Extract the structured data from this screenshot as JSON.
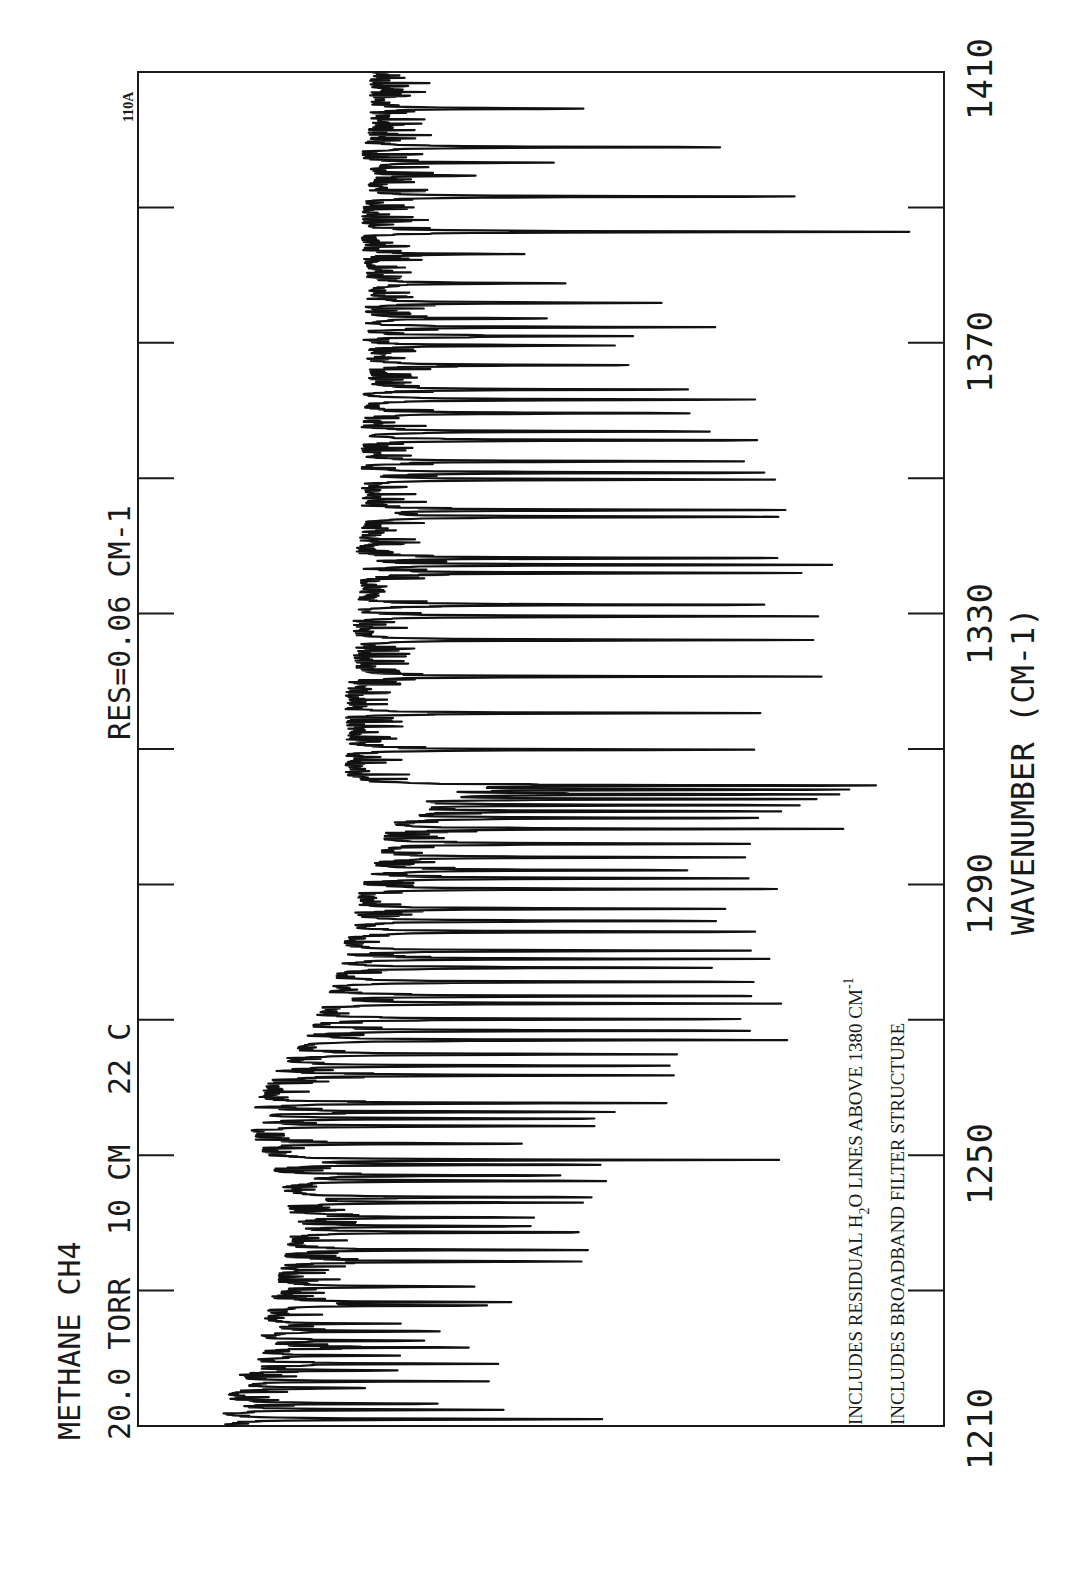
{
  "chart_data": {
    "type": "line",
    "orientation": "rotated-90-ccw",
    "title": "METHANE  CH4",
    "subtitle": "20.0 TORR  10 CM  22 C",
    "annotation_res": "RES=0.06 CM-1",
    "plot_id": "110A",
    "notes": [
      "INCLUDES RESIDUAL H2O LINES ABOVE 1380 CM-1",
      "INCLUDES BROADBAND FILTER STRUCTURE"
    ],
    "xlabel": "WAVENUMBER (CM-1)",
    "ylabel": "",
    "xlim": [
      1210,
      1410
    ],
    "ylim": [
      0,
      1
    ],
    "xticks": [
      1210,
      1250,
      1290,
      1330,
      1370,
      1410
    ],
    "minor_ticks": [
      1230,
      1270,
      1310,
      1350,
      1390
    ],
    "grid": false,
    "legend": null,
    "baseline_transmittance": [
      [
        1210,
        0.89
      ],
      [
        1214,
        0.88
      ],
      [
        1218,
        0.86
      ],
      [
        1222,
        0.84
      ],
      [
        1226,
        0.83
      ],
      [
        1230,
        0.82
      ],
      [
        1234,
        0.81
      ],
      [
        1238,
        0.8
      ],
      [
        1242,
        0.8
      ],
      [
        1246,
        0.81
      ],
      [
        1250,
        0.83
      ],
      [
        1254,
        0.85
      ],
      [
        1258,
        0.84
      ],
      [
        1262,
        0.82
      ],
      [
        1266,
        0.79
      ],
      [
        1270,
        0.77
      ],
      [
        1274,
        0.75
      ],
      [
        1278,
        0.74
      ],
      [
        1282,
        0.73
      ],
      [
        1286,
        0.72
      ],
      [
        1290,
        0.71
      ],
      [
        1294,
        0.69
      ],
      [
        1298,
        0.68
      ],
      [
        1302,
        0.67
      ],
      [
        1304,
        0.66
      ],
      [
        1306,
        0.73
      ],
      [
        1310,
        0.73
      ],
      [
        1314,
        0.73
      ],
      [
        1318,
        0.73
      ],
      [
        1322,
        0.72
      ],
      [
        1326,
        0.72
      ],
      [
        1330,
        0.72
      ],
      [
        1334,
        0.71
      ],
      [
        1338,
        0.72
      ],
      [
        1342,
        0.71
      ],
      [
        1346,
        0.71
      ],
      [
        1350,
        0.71
      ],
      [
        1354,
        0.71
      ],
      [
        1358,
        0.71
      ],
      [
        1362,
        0.71
      ],
      [
        1366,
        0.7
      ],
      [
        1370,
        0.71
      ],
      [
        1374,
        0.71
      ],
      [
        1378,
        0.7
      ],
      [
        1382,
        0.71
      ],
      [
        1386,
        0.71
      ],
      [
        1390,
        0.71
      ],
      [
        1394,
        0.7
      ],
      [
        1398,
        0.71
      ],
      [
        1402,
        0.7
      ],
      [
        1406,
        0.7
      ],
      [
        1410,
        0.7
      ]
    ],
    "absorption_lines": [
      {
        "wn": 1211.0,
        "t": 0.4
      },
      {
        "wn": 1212.4,
        "t": 0.55
      },
      {
        "wn": 1213.3,
        "t": 0.62
      },
      {
        "wn": 1215.6,
        "t": 0.71
      },
      {
        "wn": 1216.6,
        "t": 0.62
      },
      {
        "wn": 1218.2,
        "t": 0.68
      },
      {
        "wn": 1219.2,
        "t": 0.6
      },
      {
        "wn": 1220.4,
        "t": 0.67
      },
      {
        "wn": 1221.6,
        "t": 0.58
      },
      {
        "wn": 1222.6,
        "t": 0.65
      },
      {
        "wn": 1224.0,
        "t": 0.61
      },
      {
        "wn": 1225.1,
        "t": 0.72
      },
      {
        "wn": 1227.8,
        "t": 0.57
      },
      {
        "wn": 1228.3,
        "t": 0.55
      },
      {
        "wn": 1230.6,
        "t": 0.56
      },
      {
        "wn": 1234.3,
        "t": 0.44
      },
      {
        "wn": 1236.0,
        "t": 0.48
      },
      {
        "wn": 1238.6,
        "t": 0.44
      },
      {
        "wn": 1239.5,
        "t": 0.51
      },
      {
        "wn": 1240.8,
        "t": 0.5
      },
      {
        "wn": 1243.0,
        "t": 0.45
      },
      {
        "wn": 1243.8,
        "t": 0.43
      },
      {
        "wn": 1246.2,
        "t": 0.41
      },
      {
        "wn": 1247.0,
        "t": 0.46
      },
      {
        "wn": 1248.6,
        "t": 0.41
      },
      {
        "wn": 1249.3,
        "t": 0.26
      },
      {
        "wn": 1251.7,
        "t": 0.52
      },
      {
        "wn": 1254.3,
        "t": 0.41
      },
      {
        "wn": 1255.4,
        "t": 0.42
      },
      {
        "wn": 1256.4,
        "t": 0.4
      },
      {
        "wn": 1257.7,
        "t": 0.35
      },
      {
        "wn": 1261.8,
        "t": 0.32
      },
      {
        "wn": 1263.2,
        "t": 0.33
      },
      {
        "wn": 1264.9,
        "t": 0.32
      },
      {
        "wn": 1267.0,
        "t": 0.21
      },
      {
        "wn": 1268.4,
        "t": 0.21
      },
      {
        "wn": 1270.1,
        "t": 0.23
      },
      {
        "wn": 1272.4,
        "t": 0.21
      },
      {
        "wn": 1273.5,
        "t": 0.22
      },
      {
        "wn": 1275.6,
        "t": 0.27
      },
      {
        "wn": 1277.7,
        "t": 0.31
      },
      {
        "wn": 1279.0,
        "t": 0.26
      },
      {
        "wn": 1280.2,
        "t": 0.24
      },
      {
        "wn": 1283.0,
        "t": 0.21
      },
      {
        "wn": 1284.6,
        "t": 0.27
      },
      {
        "wn": 1286.4,
        "t": 0.26
      },
      {
        "wn": 1289.3,
        "t": 0.23
      },
      {
        "wn": 1290.9,
        "t": 0.22
      },
      {
        "wn": 1292.1,
        "t": 0.31
      },
      {
        "wn": 1294.0,
        "t": 0.26
      },
      {
        "wn": 1296.0,
        "t": 0.21
      },
      {
        "wn": 1298.2,
        "t": 0.18
      },
      {
        "wn": 1299.8,
        "t": 0.2
      },
      {
        "wn": 1300.8,
        "t": 0.18
      },
      {
        "wn": 1301.7,
        "t": 0.16
      },
      {
        "wn": 1302.6,
        "t": 0.14
      },
      {
        "wn": 1303.3,
        "t": 0.12
      },
      {
        "wn": 1304.0,
        "t": 0.09
      },
      {
        "wn": 1304.6,
        "t": 0.06
      },
      {
        "wn": 1309.9,
        "t": 0.23
      },
      {
        "wn": 1315.3,
        "t": 0.22
      },
      {
        "wn": 1320.7,
        "t": 0.2
      },
      {
        "wn": 1326.1,
        "t": 0.16
      },
      {
        "wn": 1329.6,
        "t": 0.13
      },
      {
        "wn": 1331.3,
        "t": 0.19
      },
      {
        "wn": 1336.0,
        "t": 0.18
      },
      {
        "wn": 1337.2,
        "t": 0.15
      },
      {
        "wn": 1338.2,
        "t": 0.17
      },
      {
        "wn": 1344.3,
        "t": 0.18
      },
      {
        "wn": 1345.3,
        "t": 0.19
      },
      {
        "wn": 1349.8,
        "t": 0.21
      },
      {
        "wn": 1350.8,
        "t": 0.2
      },
      {
        "wn": 1352.5,
        "t": 0.26
      },
      {
        "wn": 1355.6,
        "t": 0.22
      },
      {
        "wn": 1356.9,
        "t": 0.28
      },
      {
        "wn": 1359.6,
        "t": 0.29
      },
      {
        "wn": 1361.6,
        "t": 0.22
      },
      {
        "wn": 1363.1,
        "t": 0.31
      },
      {
        "wn": 1366.7,
        "t": 0.37
      },
      {
        "wn": 1369.6,
        "t": 0.4
      },
      {
        "wn": 1371.0,
        "t": 0.38
      },
      {
        "wn": 1372.3,
        "t": 0.29
      },
      {
        "wn": 1373.6,
        "t": 0.48
      },
      {
        "wn": 1375.9,
        "t": 0.35
      },
      {
        "wn": 1378.8,
        "t": 0.45
      },
      {
        "wn": 1383.1,
        "t": 0.52
      },
      {
        "wn": 1386.4,
        "t": 0.04
      },
      {
        "wn": 1391.6,
        "t": 0.16
      },
      {
        "wn": 1394.7,
        "t": 0.58
      },
      {
        "wn": 1396.6,
        "t": 0.5
      },
      {
        "wn": 1398.9,
        "t": 0.26
      },
      {
        "wn": 1404.6,
        "t": 0.43
      }
    ]
  },
  "labels": {
    "title_line1": "METHANE  CH4",
    "title_line2_a": "20.0 TORR",
    "title_line2_b": "10 CM",
    "title_line2_c": "22 C",
    "res": "RES=0.06 CM-1",
    "plot_id": "110A",
    "note1_pre": "INCLUDES RESIDUAL H",
    "note1_sub": "2",
    "note1_mid": "O LINES ABOVE 1380 CM",
    "note1_sup": "-1",
    "note2": "INCLUDES BROADBAND FILTER STRUCTURE",
    "xlabel": "WAVENUMBER (CM-1)",
    "ticks": [
      "1210",
      "1250",
      "1290",
      "1330",
      "1370",
      "1410"
    ]
  },
  "colors": {
    "ink": "#111111",
    "background": "#ffffff"
  }
}
